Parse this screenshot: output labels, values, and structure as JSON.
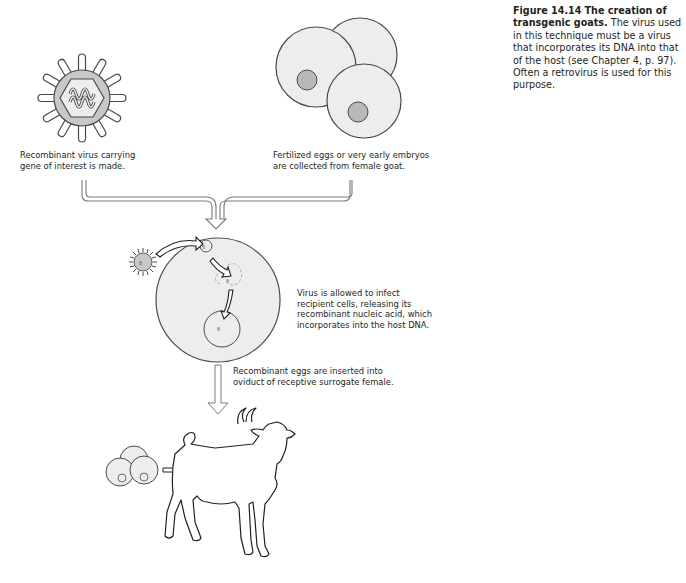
{
  "figure": {
    "number_label": "Figure 14.14",
    "title": "The creation of transgenic goats.",
    "caption_body": "The virus used in this technique must be a virus that incorporates its DNA into that of the host (see Chapter 4, p. 97). Often a retrovirus is used for this purpose."
  },
  "steps": [
    {
      "id": "virus",
      "label_lines": [
        "Recombinant virus carrying",
        "gene of interest is made."
      ]
    },
    {
      "id": "eggs",
      "label_lines": [
        "Fertilized eggs or very early embryos",
        "are collected from female goat."
      ]
    },
    {
      "id": "infection",
      "label_lines": [
        "Virus is allowed to infect",
        "recipient cells, releasing its",
        "recombinant nucleic acid, which",
        "incorporates into the host DNA."
      ]
    },
    {
      "id": "implant",
      "label_lines": [
        "Recombinant eggs are inserted into",
        "oviduct of receptive surrogate female."
      ]
    }
  ],
  "colors": {
    "outline": "#4a4a4a",
    "cell_fill": "#ededed",
    "nucleus_fill": "#b8b8b8",
    "capsid_ring": "#c8c8c8",
    "text": "#231f20"
  }
}
